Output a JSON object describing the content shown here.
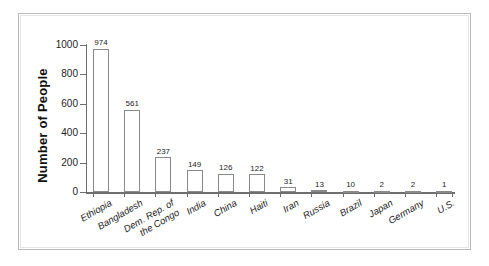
{
  "chart_data": {
    "type": "bar",
    "title": "",
    "xlabel": "",
    "ylabel": "Number of People",
    "ylim": [
      0,
      1000
    ],
    "yticks": [
      0,
      200,
      400,
      600,
      800,
      1000
    ],
    "ytick_labels": [
      "0",
      "200",
      "400",
      "600",
      "800",
      "1000"
    ],
    "grid": false,
    "legend": false,
    "bar_value_labels": true,
    "categories": [
      "Ethiopia",
      "Bangladesh",
      "Dem. Rep. of the Congo",
      "India",
      "China",
      "Haiti",
      "Iran",
      "Russia",
      "Brazil",
      "Japan",
      "Germany",
      "U.S."
    ],
    "category_label_lines": [
      [
        "Ethiopia"
      ],
      [
        "Bangladesh"
      ],
      [
        "Dem. Rep. of",
        "the Congo"
      ],
      [
        "India"
      ],
      [
        "China"
      ],
      [
        "Haiti"
      ],
      [
        "Iran"
      ],
      [
        "Russia"
      ],
      [
        "Brazil"
      ],
      [
        "Japan"
      ],
      [
        "Germany"
      ],
      [
        "U.S."
      ]
    ],
    "values": [
      974,
      561,
      237,
      149,
      126,
      122,
      31,
      13,
      10,
      2,
      2,
      1
    ],
    "value_labels": [
      "974",
      "561",
      "237",
      "149",
      "126",
      "122",
      "31",
      "13",
      "10",
      "2",
      "2",
      "1"
    ],
    "colors": {
      "bar_fill": "#ffffff",
      "bar_edge": "#8a8a8a",
      "axis": "#6e6e6e",
      "text": "#1d1d1d",
      "frame": "#b9b9b9",
      "background": "#ffffff"
    }
  }
}
